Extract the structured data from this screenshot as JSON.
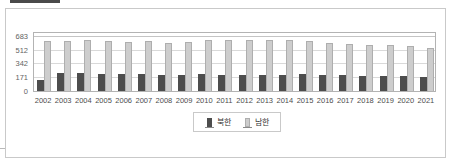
{
  "colors": {
    "north_bar": "#4d4d4d",
    "south_bar": "#cdcdcd",
    "south_bar_border": "#aeaeae",
    "grid": "#d9d9d9",
    "plot_border": "#b3b3b3",
    "card_border": "#c9c9c9",
    "tick_text": "#636363"
  },
  "chart_data": {
    "type": "bar",
    "title": "",
    "xlabel": "",
    "ylabel": "",
    "categories": [
      "2002",
      "2003",
      "2004",
      "2005",
      "2006",
      "2007",
      "2008",
      "2009",
      "2010",
      "2011",
      "2012",
      "2013",
      "2014",
      "2015",
      "2016",
      "2017",
      "2018",
      "2019",
      "2020",
      "2021"
    ],
    "series": [
      {
        "name": "북한",
        "color": "#4d4d4d",
        "values": [
          140,
          218,
          220,
          213,
          208,
          208,
          205,
          205,
          206,
          205,
          202,
          202,
          203,
          206,
          205,
          196,
          192,
          183,
          182,
          168
        ]
      },
      {
        "name": "남한",
        "color": "#cdcdcd",
        "values": [
          624,
          624,
          639,
          621,
          612,
          615,
          601,
          612,
          628,
          634,
          635,
          639,
          631,
          618,
          593,
          587,
          574,
          568,
          557,
          537
        ]
      }
    ],
    "ylim": [
      0,
      745
    ],
    "yticks": [
      0,
      171,
      342,
      512,
      683
    ],
    "ytick_labels": [
      "0",
      "171",
      "342",
      "512",
      "683"
    ],
    "grid": true,
    "legend_position": "bottom-center",
    "legend_items": [
      "북한",
      "남한"
    ]
  }
}
